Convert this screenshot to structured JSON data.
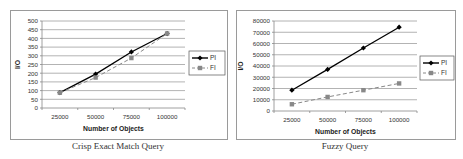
{
  "chart_data": [
    {
      "type": "line",
      "title": "Crisp Exact Match Query",
      "xlabel": "Number of Objects",
      "ylabel": "I/O",
      "categories": [
        "25000",
        "50000",
        "75000",
        "100000"
      ],
      "ylim": [
        0,
        500
      ],
      "yticks": [
        0,
        50,
        100,
        150,
        200,
        250,
        300,
        350,
        400,
        450,
        500
      ],
      "grid": true,
      "legend_position": "right",
      "series": [
        {
          "name": "PI",
          "values": [
            88,
            195,
            322,
            428
          ],
          "color": "#000000",
          "style": "solid",
          "marker": "diamond"
        },
        {
          "name": "FI",
          "values": [
            88,
            175,
            287,
            428
          ],
          "color": "#888888",
          "style": "dashed",
          "marker": "square"
        }
      ]
    },
    {
      "type": "line",
      "title": "Fuzzy Query",
      "xlabel": "Number of Objects",
      "ylabel": "I/O",
      "categories": [
        "25000",
        "50000",
        "75000",
        "100000"
      ],
      "ylim": [
        0,
        80000
      ],
      "yticks": [
        0,
        10000,
        20000,
        30000,
        40000,
        50000,
        60000,
        70000,
        80000
      ],
      "grid": true,
      "legend_position": "right",
      "series": [
        {
          "name": "PI",
          "values": [
            18500,
            37000,
            56000,
            74500
          ],
          "color": "#000000",
          "style": "solid",
          "marker": "diamond"
        },
        {
          "name": "FI",
          "values": [
            6000,
            12500,
            18500,
            24500
          ],
          "color": "#888888",
          "style": "dashed",
          "marker": "square"
        }
      ]
    }
  ],
  "captions": {
    "left": "Crisp Exact Match Query",
    "right": "Fuzzy Query"
  },
  "legend": {
    "pi": "PI",
    "fi": "FI"
  },
  "axis": {
    "xlabel": "Number of Objects",
    "ylabel": "I/O"
  }
}
